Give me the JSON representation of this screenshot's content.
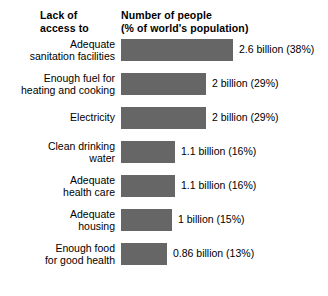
{
  "header": {
    "left_title": "Lack of\naccess to",
    "right_title": "Number of people\n(% of world's population)"
  },
  "style": {
    "bar_color": "#666666",
    "text_color": "#000000",
    "background": "#ffffff"
  },
  "chart_data": {
    "type": "bar",
    "orientation": "horizontal",
    "title": "Number of people (% of world's population)",
    "category_axis_title": "Lack of access to",
    "xlabel": "",
    "ylabel": "",
    "grid": false,
    "legend": false,
    "axis_visible": false,
    "units": "billions of people",
    "xlim": [
      0,
      2.6
    ],
    "categories": [
      "Adequate\nsanitation facilities",
      "Enough fuel for\nheating and cooking",
      "Electricity",
      "Clean drinking\nwater",
      "Adequate\nhealth care",
      "Adequate\nhousing",
      "Enough food\nfor good health"
    ],
    "values": [
      2.6,
      2,
      2,
      1.1,
      1.1,
      1,
      0.86
    ],
    "percents": [
      38,
      29,
      29,
      16,
      16,
      15,
      13
    ],
    "data_labels": [
      "2.6 billion (38%)",
      "2 billion (29%)",
      "2 billion (29%)",
      "1.1 billion (16%)",
      "1.1 billion (16%)",
      "1 billion (15%)",
      "0.86 billion (13%)"
    ],
    "bar_pixel_widths": [
      112,
      85,
      85,
      54,
      54,
      51,
      46
    ],
    "label_line_counts": [
      2,
      2,
      1,
      2,
      2,
      2,
      2
    ]
  }
}
